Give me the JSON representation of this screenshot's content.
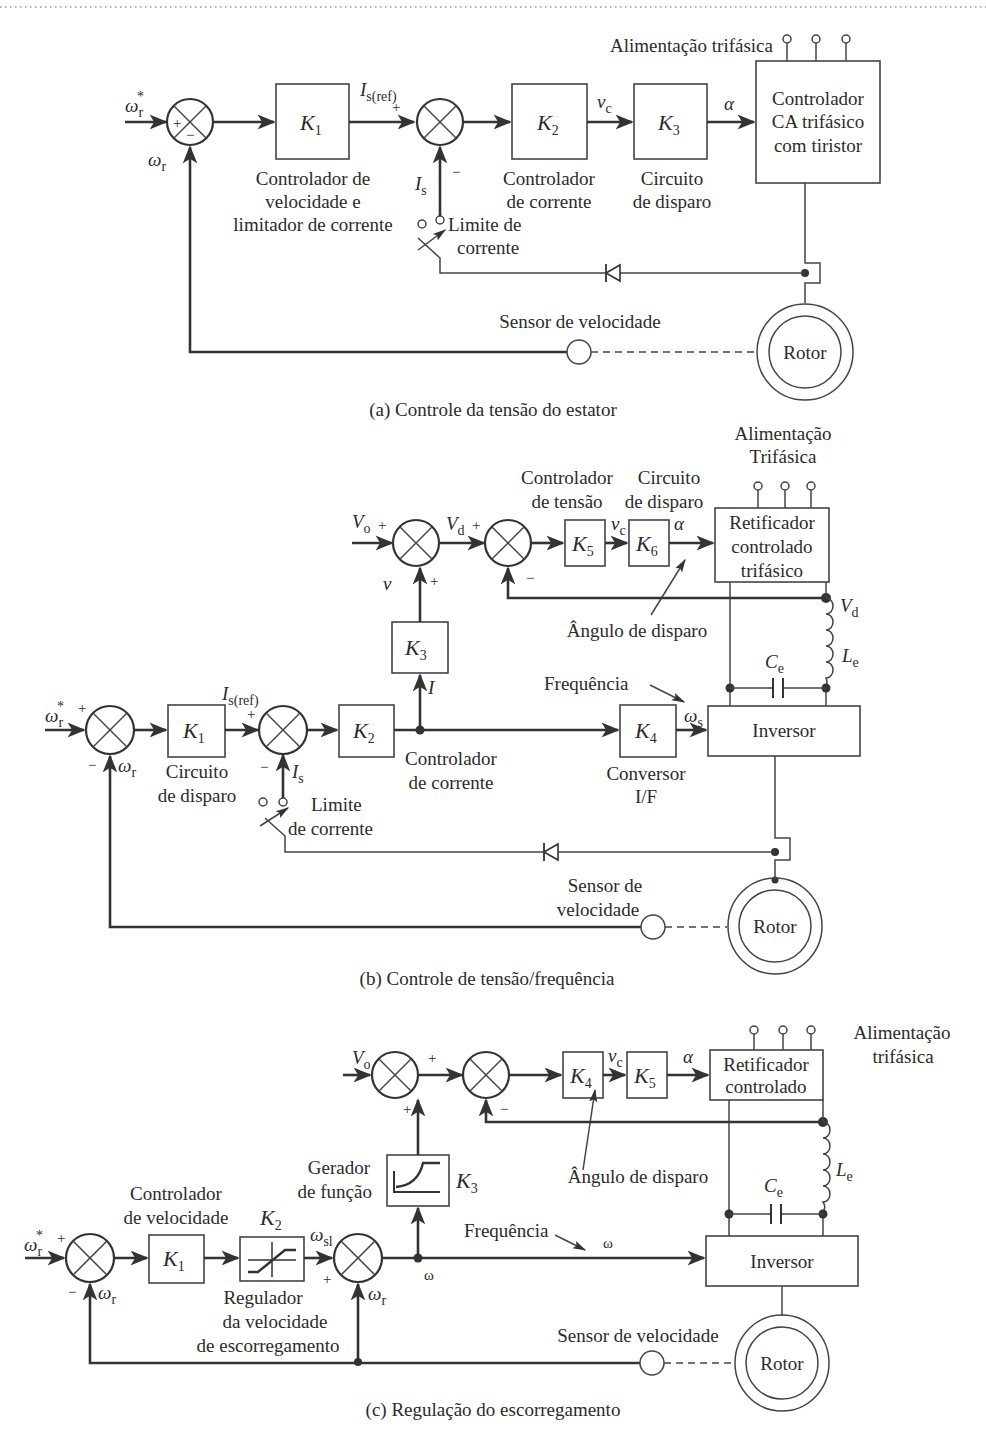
{
  "panel_a": {
    "caption": "(a) Controle da tensão do estator",
    "input_ref": "ω",
    "input_ref_sub": "r",
    "input_ref_sup": "*",
    "feedback": "ω",
    "feedback_sub": "r",
    "k1": {
      "name": "K",
      "sub": "1",
      "label": [
        "Controlador de",
        "velocidade e",
        "limitador de corrente"
      ]
    },
    "isref": "I",
    "isref_sub": "s(ref)",
    "is": "I",
    "is_sub": "s",
    "k2": {
      "name": "K",
      "sub": "2",
      "label": [
        "Controlador",
        "de corrente"
      ]
    },
    "vc": "v",
    "vc_sub": "c",
    "k3": {
      "name": "K",
      "sub": "3",
      "label": [
        "Circuito",
        "de disparo"
      ]
    },
    "alpha": "α",
    "controller": [
      "Controlador",
      "CA trifásico",
      "com tiristor"
    ],
    "supply": "Alimentação trifásica",
    "current_limit": [
      "Limite de",
      "corrente"
    ],
    "speed_sensor": "Sensor de velocidade",
    "rotor": "Rotor",
    "plus": "+",
    "minus": "−"
  },
  "panel_b": {
    "caption": "(b) Controle de tensão/frequência",
    "supply": [
      "Alimentação",
      "Trifásica"
    ],
    "vo": "V",
    "vo_sub": "o",
    "vd": "V",
    "vd_sub": "d",
    "v": "v",
    "voltage_ctrl": [
      "Controlador",
      "de tensão"
    ],
    "firing_ckt": [
      "Circuito",
      "de disparo"
    ],
    "k5": {
      "name": "K",
      "sub": "5"
    },
    "k6": {
      "name": "K",
      "sub": "6"
    },
    "vc": "v",
    "vc_sub": "c",
    "alpha": "α",
    "rectifier": [
      "Retificador",
      "controlado",
      "trifásico"
    ],
    "firing_angle": "Ângulo de disparo",
    "k3": {
      "name": "K",
      "sub": "3"
    },
    "i": "I",
    "ce": "C",
    "ce_sub": "e",
    "le": "L",
    "le_sub": "e",
    "frequency": "Frequência",
    "ws": "ω",
    "ws_sub": "s",
    "input_ref": "ω",
    "input_ref_sub": "r",
    "input_ref_sup": "*",
    "feedback": "ω",
    "feedback_sub": "r",
    "k1": {
      "name": "K",
      "sub": "1",
      "label": [
        "Circuito",
        "de disparo"
      ]
    },
    "isref": "I",
    "isref_sub": "s(ref)",
    "is": "I",
    "is_sub": "s",
    "k2": {
      "name": "K",
      "sub": "2",
      "label": [
        "Controlador",
        "de corrente"
      ]
    },
    "k4": {
      "name": "K",
      "sub": "4",
      "label": [
        "Conversor",
        "I/F"
      ]
    },
    "inverter": "Inversor",
    "current_limit": [
      "Limite",
      "de corrente"
    ],
    "speed_sensor": [
      "Sensor de",
      "velocidade"
    ],
    "rotor": "Rotor",
    "plus": "+",
    "minus": "−"
  },
  "panel_c": {
    "caption": "(c) Regulação do escorregamento",
    "supply": [
      "Alimentação",
      "trifásica"
    ],
    "vo": "V",
    "vo_sub": "o",
    "k4": {
      "name": "K",
      "sub": "4"
    },
    "k5": {
      "name": "K",
      "sub": "5"
    },
    "vc": "v",
    "vc_sub": "c",
    "alpha": "α",
    "rectifier": [
      "Retificador",
      "controlado"
    ],
    "firing_angle": "Ângulo de disparo",
    "function_gen": [
      "Gerador",
      "de função"
    ],
    "k3": {
      "name": "K",
      "sub": "3"
    },
    "le": "L",
    "le_sub": "e",
    "ce": "C",
    "ce_sub": "e",
    "speed_ctrl": [
      "Controlador",
      "de velocidade"
    ],
    "k1": {
      "name": "K",
      "sub": "1"
    },
    "k2": {
      "name": "K",
      "sub": "2",
      "label": [
        "Regulador",
        "da velocidade",
        "de escorregamento"
      ]
    },
    "wsl": "ω",
    "wsl_sub": "sl",
    "input_ref": "ω",
    "input_ref_sub": "r",
    "input_ref_sup": "*",
    "feedback": "ω",
    "feedback_sub": "r",
    "omega": "ω",
    "frequency": "Frequência",
    "inverter": "Inversor",
    "speed_sensor": "Sensor de velocidade",
    "rotor": "Rotor",
    "plus": "+",
    "minus": "−"
  }
}
